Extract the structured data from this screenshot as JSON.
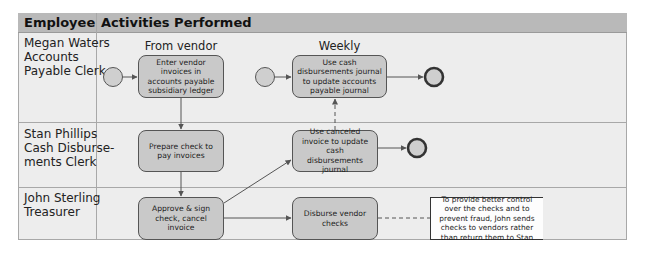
{
  "table": {
    "headers": {
      "employee": "Employee",
      "activities": "Activities Performed"
    },
    "rows": [
      {
        "employee": "Megan Waters\nAccounts\nPayable Clerk"
      },
      {
        "employee": "Stan Phillips\nCash Disburse-\nments Clerk"
      },
      {
        "employee": "John Sterling\nTreasurer"
      }
    ]
  },
  "labels": {
    "from_vendor": "From vendor",
    "weekly": "Weekly"
  },
  "activities": {
    "enter_invoices": "Enter vendor invoices in accounts payable subsidiary ledger",
    "update_ap_journal": "Use cash disbursements journal to update accounts payable journal",
    "prepare_check": "Prepare check to pay invoices",
    "update_cd_journal": "Use canceled invoice to update cash disbursements journal",
    "approve_sign": "Approve & sign check, cancel invoice",
    "disburse_checks": "Disburse vendor checks"
  },
  "note": "To provide better control over the checks and to prevent fraud, John sends checks to vendors rather than return them to Stan",
  "colors": {
    "header_bg": "#b9b9b9",
    "lane_bg": "#ededed",
    "box_fill": "#c9c9c9",
    "line": "#555555",
    "border": "#a8a8a8"
  }
}
